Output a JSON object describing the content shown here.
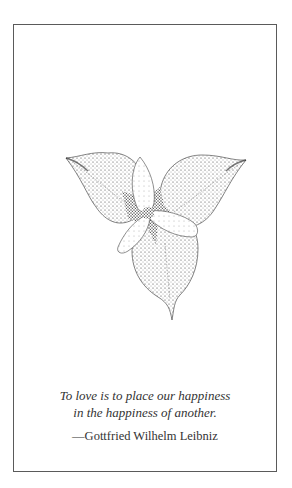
{
  "card": {
    "border_color": "#5a5a5a",
    "background": "#ffffff"
  },
  "illustration": {
    "subject": "trillium-flower-stipple-drawing",
    "leaves": 3,
    "petals": 3
  },
  "quote": {
    "lines": [
      "To love is to place our happiness",
      "in the happiness of another."
    ],
    "attribution": "—Gottfried Wilhelm Leibniz",
    "text_color": "#333333"
  }
}
